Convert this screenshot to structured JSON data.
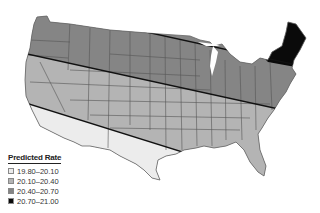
{
  "map": {
    "region": "Contiguous United States",
    "colors": {
      "band1": "#ececec",
      "band2": "#b4b4b4",
      "band3": "#858585",
      "band4": "#0a0a0a",
      "border": "#555555",
      "divider": "#111111"
    }
  },
  "legend": {
    "title": "Predicted Rate",
    "items": [
      {
        "label": "19.80–20.10",
        "color": "#ececec"
      },
      {
        "label": "20.10–20.40",
        "color": "#b4b4b4"
      },
      {
        "label": "20.40–20.70",
        "color": "#858585"
      },
      {
        "label": "20.70–21.00",
        "color": "#0a0a0a"
      }
    ]
  }
}
